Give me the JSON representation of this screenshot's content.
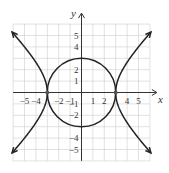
{
  "chart_data": {
    "type": "line",
    "title": "",
    "xlabel": "x",
    "ylabel": "y",
    "xlim": [
      -6,
      6
    ],
    "ylim": [
      -6,
      6
    ],
    "grid": true,
    "x_tick_labels": [
      "-5",
      "-4",
      "-2",
      "-1",
      "1",
      "2",
      "4",
      "5"
    ],
    "y_tick_labels": [
      "5",
      "4",
      "2",
      "1",
      "-1",
      "-2",
      "-4",
      "-5"
    ],
    "series": [
      {
        "name": "circle",
        "equation": "x^2 + y^2 = 9",
        "center": [
          0,
          0
        ],
        "radius": 3
      },
      {
        "name": "hyperbola",
        "equation": "x^2 - y^2 = 9",
        "vertices": [
          [
            -3,
            0
          ],
          [
            3,
            0
          ]
        ]
      }
    ],
    "intersection_points": [
      [
        -3,
        0
      ],
      [
        3,
        0
      ]
    ],
    "colors": {
      "curve": "#222222",
      "grid": "#cccccc",
      "axis": "#333333"
    }
  },
  "labels": {
    "x": "x",
    "y": "y"
  },
  "ticks": {
    "x": [
      {
        "v": -5,
        "t": "-5"
      },
      {
        "v": -4,
        "t": "-4"
      },
      {
        "v": -2,
        "t": "-2"
      },
      {
        "v": -1,
        "t": "-1"
      },
      {
        "v": 1,
        "t": "1"
      },
      {
        "v": 2,
        "t": "2"
      },
      {
        "v": 4,
        "t": "4"
      },
      {
        "v": 5,
        "t": "5"
      }
    ],
    "y": [
      {
        "v": 5,
        "t": "5"
      },
      {
        "v": 4,
        "t": "4"
      },
      {
        "v": 2,
        "t": "2"
      },
      {
        "v": 1,
        "t": "1"
      },
      {
        "v": -1,
        "t": "-1"
      },
      {
        "v": -2,
        "t": "-2"
      },
      {
        "v": -4,
        "t": "-4"
      },
      {
        "v": -5,
        "t": "-5"
      }
    ]
  }
}
